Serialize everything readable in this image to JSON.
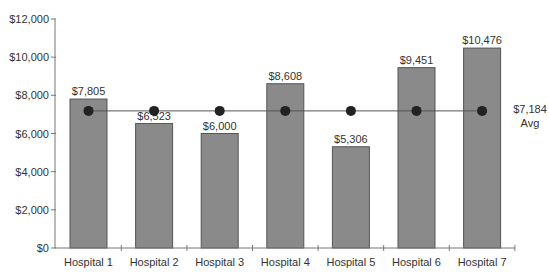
{
  "chart_data": {
    "type": "bar",
    "title": "",
    "xlabel": "",
    "ylabel": "",
    "ylim": [
      0,
      12000
    ],
    "yticks": [
      0,
      2000,
      4000,
      6000,
      8000,
      10000,
      12000
    ],
    "ytick_labels": [
      "$0",
      "$2,000",
      "$4,000",
      "$6,000",
      "$8,000",
      "$10,000",
      "$12,000"
    ],
    "categories": [
      "Hospital 1",
      "Hospital 2",
      "Hospital 3",
      "Hospital 4",
      "Hospital 5",
      "Hospital 6",
      "Hospital 7"
    ],
    "series": [
      {
        "name": "Cost",
        "values": [
          7805,
          6523,
          6000,
          8608,
          5306,
          9451,
          10476
        ],
        "labels": [
          "$7,805",
          "$6,523",
          "$6,000",
          "$8,608",
          "$5,306",
          "$9,451",
          "$10,476"
        ],
        "color": "#8a8a8a"
      },
      {
        "name": "Avg",
        "type": "line",
        "values": [
          7184,
          7184,
          7184,
          7184,
          7184,
          7184,
          7184
        ],
        "color": "#222222"
      }
    ],
    "annotations": [
      {
        "text": "$7,184",
        "position": "right of average line"
      },
      {
        "text": "Avg",
        "position": "right of average line, below value"
      }
    ],
    "grid": false,
    "legend": "none"
  },
  "labels": {
    "avg_value": "$7,184",
    "avg_text": "Avg"
  }
}
